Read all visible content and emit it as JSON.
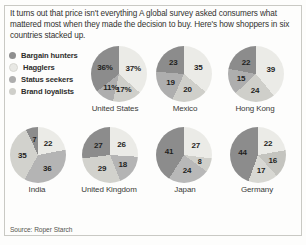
{
  "intro": {
    "text": "It turns out that price isn't everything  A global survey asked consumers what mattered most when they made the decision to buy. Here's how shoppers in six countries stacked up."
  },
  "legend": {
    "items": [
      {
        "label": "Bargain hunters",
        "color": "#8f8f8f",
        "icon": "legend-dot-icon"
      },
      {
        "label": "Hagglers",
        "color": "#e8e8e4",
        "icon": "legend-dot-icon"
      },
      {
        "label": "Status seekers",
        "color": "#adadad",
        "icon": "legend-dot-icon"
      },
      {
        "label": "Brand loyalists",
        "color": "#cfcfca",
        "icon": "legend-dot-icon"
      }
    ]
  },
  "source": {
    "text": "Source: Roper Starch"
  },
  "chart_data": {
    "type": "pie",
    "title": "It turns out that price isn't everything",
    "note": "Share of shoppers by buying motivation, six countries",
    "legend_position": "top-left",
    "categories": [
      "Bargain hunters",
      "Hagglers",
      "Status seekers",
      "Brand loyalists"
    ],
    "colors": [
      "#8f8f8f",
      "#e8e8e4",
      "#adadad",
      "#cfcfca"
    ],
    "charts": [
      {
        "country": "United States",
        "labels": [
          "37%",
          "17%",
          "11%",
          "36%"
        ],
        "values": [
          37,
          17,
          11,
          36
        ],
        "slice_order": [
          "Hagglers",
          "Brand loyalists",
          "Status seekers",
          "Bargain hunters"
        ],
        "slice_colors": [
          "#ebebe7",
          "#cfcfca",
          "#aeaeae",
          "#8c8c8c"
        ]
      },
      {
        "country": "Mexico",
        "labels": [
          "35",
          "20",
          "19",
          "23"
        ],
        "values": [
          35,
          20,
          19,
          23
        ],
        "slice_order": [
          "Hagglers",
          "Brand loyalists",
          "Status seekers",
          "Bargain hunters"
        ],
        "slice_colors": [
          "#ebebe7",
          "#cfcfca",
          "#aeaeae",
          "#8c8c8c"
        ]
      },
      {
        "country": "Hong Kong",
        "labels": [
          "39",
          "24",
          "15",
          "22"
        ],
        "values": [
          39,
          24,
          15,
          22
        ],
        "slice_order": [
          "Hagglers",
          "Brand loyalists",
          "Status seekers",
          "Bargain hunters"
        ],
        "slice_colors": [
          "#ebebe7",
          "#cfcfca",
          "#aeaeae",
          "#8c8c8c"
        ]
      },
      {
        "country": "India",
        "labels": [
          "22",
          "36",
          "35",
          "7"
        ],
        "values": [
          22,
          36,
          35,
          7
        ],
        "slice_order": [
          "Hagglers",
          "Brand loyalists",
          "Status seekers",
          "Bargain hunters"
        ],
        "slice_colors": [
          "#ebebe7",
          "#b4b4b4",
          "#d2d2cd",
          "#8c8c8c"
        ]
      },
      {
        "country": "United Kingdom",
        "labels": [
          "26",
          "18",
          "29",
          "27"
        ],
        "values": [
          26,
          18,
          29,
          27
        ],
        "slice_order": [
          "Hagglers",
          "Brand loyalists",
          "Status seekers",
          "Bargain hunters"
        ],
        "slice_colors": [
          "#ebebe7",
          "#b4b4b4",
          "#d2d2cd",
          "#8c8c8c"
        ]
      },
      {
        "country": "Japan",
        "labels": [
          "27",
          "8",
          "24",
          "41"
        ],
        "values": [
          27,
          8,
          24,
          41
        ],
        "slice_order": [
          "Hagglers",
          "Brand loyalists",
          "Status seekers",
          "Bargain hunters"
        ],
        "slice_colors": [
          "#ebebe7",
          "#cfcfca",
          "#b8b8b8",
          "#8c8c8c"
        ]
      },
      {
        "country": "Germany",
        "labels": [
          "22",
          "16",
          "17",
          "44"
        ],
        "values": [
          22,
          16,
          17,
          44
        ],
        "slice_order": [
          "Hagglers",
          "Brand loyalists",
          "Status seekers",
          "Bargain hunters"
        ],
        "slice_colors": [
          "#ebebe7",
          "#c4c4bf",
          "#d8d8d3",
          "#8c8c8c"
        ]
      }
    ]
  }
}
